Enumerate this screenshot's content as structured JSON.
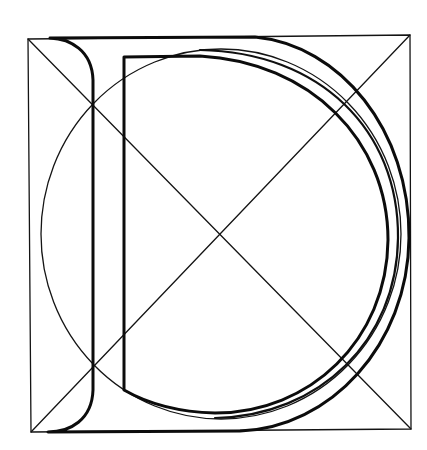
{
  "figure": {
    "title": "Construction of the letter D",
    "letter": "D",
    "colors": {
      "background": "#ffffff",
      "ink": "#111111"
    },
    "elements": [
      "bounding-square",
      "diagonal-tl-br",
      "diagonal-bl-tr",
      "construction-circle",
      "outer-letter-outline",
      "inner-letter-outline",
      "middle-bowl-curve"
    ]
  }
}
